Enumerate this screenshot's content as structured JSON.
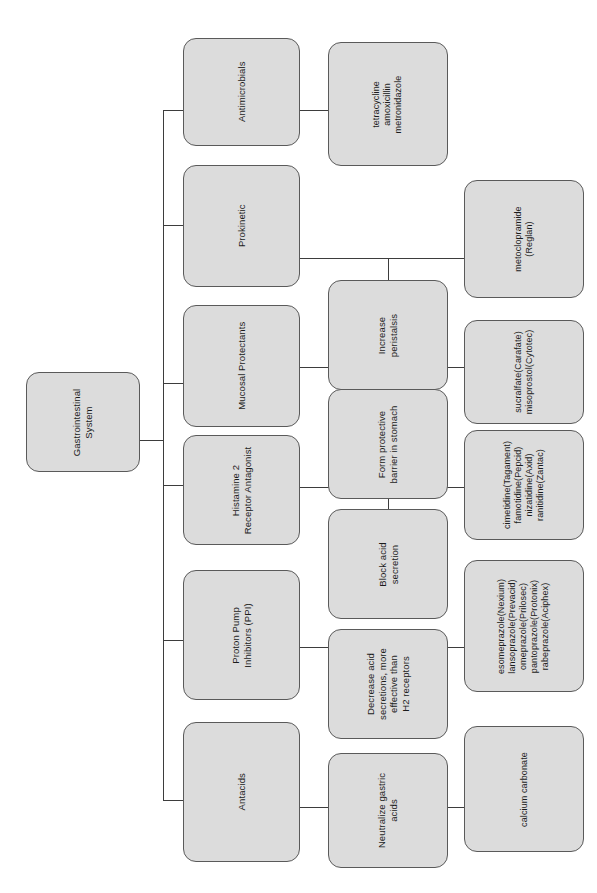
{
  "diagram": {
    "title": "Gastrointestinal System",
    "orientation": "rotated-90",
    "style": {
      "node_fill": "#dcdcdc",
      "node_border": "#5a5a5a",
      "connector": "#3d3d3d",
      "background": "#ffffff",
      "text": "#1b1b1b"
    },
    "root": {
      "label": "Gastrointestinal\nSystem"
    },
    "branches": [
      {
        "category": "Antimicrobials",
        "mechanism": null,
        "drugs": "tetracycline\namoxicillin\nmetronidazole"
      },
      {
        "category": "Prokinetic",
        "mechanism": "Increase\nperistalsis",
        "drugs": "metoclopramide\n(Reglan)"
      },
      {
        "category": "Mucosal Protectants",
        "mechanism": "Form protective\nbarrier in stomach",
        "drugs": "sucralfate(Carafate)\nmisoprostol(Cytotec)"
      },
      {
        "category": "Histamine 2\nReceptor Antagonist",
        "mechanism": "Block acid\nsecretion",
        "drugs": "cimetidine(Tagament)\nfamotidine(Pepcid)\nnizatidine(Axid)\nranitidine(Zantac)"
      },
      {
        "category": "Proton Pump\nInhibitors (PPI)",
        "mechanism": "Decrease acid\nsecretions, more\neffective than\nH2 receptors",
        "drugs": "esomeprazole(Nexium)\nlansoprazole(Prevacid)\nomeprazole(Prilosec)\npantoprazole(Protonix)\nrabeprazole(Aciphex)"
      },
      {
        "category": "Antacids",
        "mechanism": "Neutralize gastric\nacids",
        "drugs": "calcium carbonate"
      }
    ]
  }
}
